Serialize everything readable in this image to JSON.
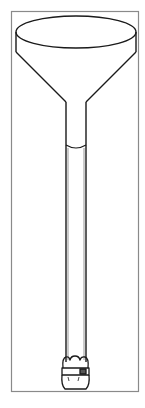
{
  "figure": {
    "colors": {
      "background": "#ffffff",
      "line": "#1a1a1a",
      "frame": "#8a8a8a"
    },
    "frame": {
      "x": 11,
      "y": 11,
      "width": 128,
      "height": 381
    },
    "funnel": {
      "rim": {
        "cx": 76,
        "cy": 32,
        "rx": 60,
        "ry": 16
      },
      "rim_side_bottom_y": 52,
      "stem": {
        "left_x": 66,
        "right_x": 86,
        "top_y": 102,
        "bottom_y": 362
      }
    },
    "meniscus_y": 146,
    "stopper": {
      "top_y": 356,
      "bottom_y": 390
    }
  }
}
